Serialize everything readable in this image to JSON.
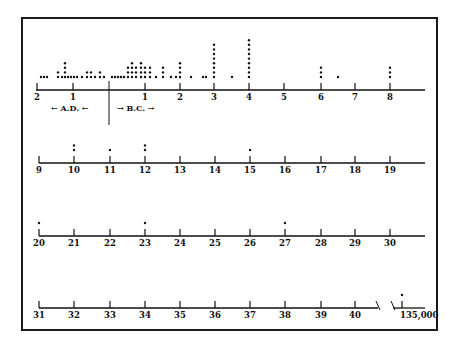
{
  "chart_data": {
    "type": "dot-plot",
    "title": "",
    "era_labels": {
      "ad": "← A.D. ←",
      "bc": "→ B.C. →"
    },
    "colors": {
      "ink": "#111111",
      "background": "#ffffff"
    },
    "rows": [
      {
        "baseline_y": 90,
        "x_start": 36,
        "x_end": 425,
        "ticks": [
          {
            "label": "2",
            "x": 37
          },
          {
            "label": "1",
            "x": 73
          },
          {
            "label": "1",
            "x": 145
          },
          {
            "label": "2",
            "x": 180
          },
          {
            "label": "3",
            "x": 214
          },
          {
            "label": "4",
            "x": 249
          },
          {
            "label": "5",
            "x": 284
          },
          {
            "label": "6",
            "x": 321
          },
          {
            "label": "7",
            "x": 355
          },
          {
            "label": "8",
            "x": 390
          }
        ],
        "divider_x": 109,
        "dot_columns": [
          {
            "x": 41,
            "count": 1
          },
          {
            "x": 44,
            "count": 1
          },
          {
            "x": 47,
            "count": 1
          },
          {
            "x": 58,
            "count": 2
          },
          {
            "x": 62,
            "count": 1
          },
          {
            "x": 65,
            "count": 4
          },
          {
            "x": 68,
            "count": 1
          },
          {
            "x": 71,
            "count": 1
          },
          {
            "x": 74,
            "count": 1
          },
          {
            "x": 77,
            "count": 1
          },
          {
            "x": 82,
            "count": 1
          },
          {
            "x": 87,
            "count": 2
          },
          {
            "x": 91,
            "count": 2
          },
          {
            "x": 95,
            "count": 1
          },
          {
            "x": 100,
            "count": 2
          },
          {
            "x": 104,
            "count": 1
          },
          {
            "x": 112,
            "count": 1
          },
          {
            "x": 115,
            "count": 1
          },
          {
            "x": 118,
            "count": 1
          },
          {
            "x": 121,
            "count": 1
          },
          {
            "x": 124,
            "count": 1
          },
          {
            "x": 128,
            "count": 3
          },
          {
            "x": 132,
            "count": 4
          },
          {
            "x": 136,
            "count": 3
          },
          {
            "x": 141,
            "count": 4
          },
          {
            "x": 145,
            "count": 3
          },
          {
            "x": 150,
            "count": 3
          },
          {
            "x": 156,
            "count": 1
          },
          {
            "x": 163,
            "count": 3
          },
          {
            "x": 171,
            "count": 1
          },
          {
            "x": 176,
            "count": 1
          },
          {
            "x": 180,
            "count": 4
          },
          {
            "x": 191,
            "count": 1
          },
          {
            "x": 203,
            "count": 1
          },
          {
            "x": 206,
            "count": 1
          },
          {
            "x": 214,
            "count": 8
          },
          {
            "x": 232,
            "count": 1
          },
          {
            "x": 249,
            "count": 9
          },
          {
            "x": 321,
            "count": 3
          },
          {
            "x": 338,
            "count": 1
          },
          {
            "x": 390,
            "count": 3
          }
        ]
      },
      {
        "baseline_y": 163,
        "x_start": 39,
        "x_end": 425,
        "ticks": [
          {
            "label": "9",
            "x": 39
          },
          {
            "label": "10",
            "x": 74
          },
          {
            "label": "11",
            "x": 110
          },
          {
            "label": "12",
            "x": 145
          },
          {
            "label": "13",
            "x": 180
          },
          {
            "label": "14",
            "x": 215
          },
          {
            "label": "15",
            "x": 250
          },
          {
            "label": "16",
            "x": 285
          },
          {
            "label": "17",
            "x": 321
          },
          {
            "label": "18",
            "x": 355
          },
          {
            "label": "19",
            "x": 390
          }
        ],
        "dot_columns": [
          {
            "x": 74,
            "count": 2
          },
          {
            "x": 110,
            "count": 1
          },
          {
            "x": 145,
            "count": 2
          },
          {
            "x": 250,
            "count": 1
          }
        ]
      },
      {
        "baseline_y": 236,
        "x_start": 39,
        "x_end": 425,
        "ticks": [
          {
            "label": "20",
            "x": 39
          },
          {
            "label": "21",
            "x": 74
          },
          {
            "label": "22",
            "x": 110
          },
          {
            "label": "23",
            "x": 145
          },
          {
            "label": "24",
            "x": 180
          },
          {
            "label": "25",
            "x": 215
          },
          {
            "label": "26",
            "x": 250
          },
          {
            "label": "27",
            "x": 285
          },
          {
            "label": "28",
            "x": 321
          },
          {
            "label": "29",
            "x": 355
          },
          {
            "label": "30",
            "x": 390
          }
        ],
        "dot_columns": [
          {
            "x": 39,
            "count": 1
          },
          {
            "x": 145,
            "count": 1
          },
          {
            "x": 285,
            "count": 1
          }
        ]
      },
      {
        "baseline_y": 308,
        "x_start": 39,
        "x_end": 378,
        "break_x": [
          378,
          393
        ],
        "x_resume": 393,
        "x_end2": 425,
        "ticks": [
          {
            "label": "31",
            "x": 39
          },
          {
            "label": "32",
            "x": 74
          },
          {
            "label": "33",
            "x": 110
          },
          {
            "label": "34",
            "x": 145
          },
          {
            "label": "35",
            "x": 180
          },
          {
            "label": "36",
            "x": 215
          },
          {
            "label": "37",
            "x": 250
          },
          {
            "label": "38",
            "x": 285
          },
          {
            "label": "39",
            "x": 321
          },
          {
            "label": "40",
            "x": 355
          },
          {
            "label": "135,000",
            "x": 402
          }
        ],
        "dot_columns": [
          {
            "x": 402,
            "count": 1
          }
        ]
      }
    ],
    "legend": null,
    "grid": false
  }
}
